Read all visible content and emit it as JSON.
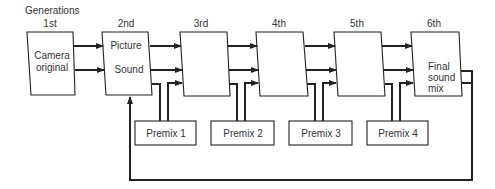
{
  "title": "Generations",
  "generations": [
    {
      "label": "1st",
      "lines": [
        "Camera",
        "original"
      ]
    },
    {
      "label": "2nd",
      "lines": [
        "Picture",
        "Sound"
      ]
    },
    {
      "label": "3rd",
      "lines": []
    },
    {
      "label": "4th",
      "lines": []
    },
    {
      "label": "5th",
      "lines": []
    },
    {
      "label": "6th",
      "lines": [
        "Final",
        "sound",
        "mix"
      ]
    }
  ],
  "premixes": [
    {
      "label": "Premix 1"
    },
    {
      "label": "Premix 2"
    },
    {
      "label": "Premix 3"
    },
    {
      "label": "Premix 4"
    }
  ],
  "colors": {
    "stroke": "#222222",
    "text": "#333333",
    "background": "#ffffff"
  }
}
